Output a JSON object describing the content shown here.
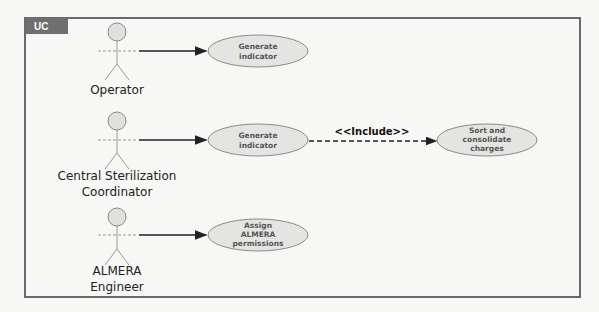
{
  "frame": {
    "label": "UC",
    "colors": {
      "tag_bg": "#6f6f6f",
      "border": "#6a6a6a"
    }
  },
  "actors": [
    {
      "id": "operator",
      "label_lines": [
        "Operator"
      ]
    },
    {
      "id": "central-sterilization-coordinator",
      "label_lines": [
        "Central Sterilization",
        "Coordinator"
      ]
    },
    {
      "id": "almera-engineer",
      "label_lines": [
        "ALMERA",
        "Engineer"
      ]
    }
  ],
  "use_cases": [
    {
      "id": "generate-indicator-1",
      "text_lines": [
        "Generate",
        "indicator"
      ]
    },
    {
      "id": "generate-indicator-2",
      "text_lines": [
        "Generate",
        "indicator"
      ]
    },
    {
      "id": "sort-consolidate-charges",
      "text_lines": [
        "Sort and",
        "consolidate",
        "charges"
      ]
    },
    {
      "id": "assign-almera-permissions",
      "text_lines": [
        "Assign",
        "ALMERA",
        "permissions"
      ]
    }
  ],
  "relations": [
    {
      "from": "operator",
      "to": "generate-indicator-1",
      "type": "association"
    },
    {
      "from": "central-sterilization-coordinator",
      "to": "generate-indicator-2",
      "type": "association"
    },
    {
      "from": "generate-indicator-2",
      "to": "sort-consolidate-charges",
      "type": "include",
      "label": "<<Include>>"
    },
    {
      "from": "almera-engineer",
      "to": "assign-almera-permissions",
      "type": "association"
    }
  ],
  "colors": {
    "usecase_fill": "#e4e4e2",
    "usecase_stroke": "#8a8a8a",
    "actor_head_fill": "#e0e0de",
    "line": "#222222"
  }
}
